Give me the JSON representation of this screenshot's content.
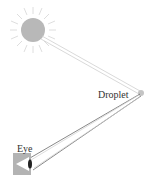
{
  "diagram": {
    "labels": {
      "droplet": "Droplet",
      "eye": "Eye"
    },
    "nodes": [
      {
        "id": "sun",
        "x": 33,
        "y": 30
      },
      {
        "id": "droplet",
        "x": 141,
        "y": 93
      },
      {
        "id": "eye",
        "x": 25,
        "y": 163
      }
    ],
    "edges": [
      {
        "from": "sun",
        "to": "droplet",
        "style": "double-line"
      },
      {
        "from": "droplet",
        "to": "eye",
        "style": "double-line-diverging"
      }
    ],
    "colors": {
      "sun": "#b5b5b5",
      "rays": "#d0d0d0",
      "beam": "#c8c8c8",
      "eye_box": "#b0b0b0",
      "droplet": "#c0c0c0"
    }
  }
}
